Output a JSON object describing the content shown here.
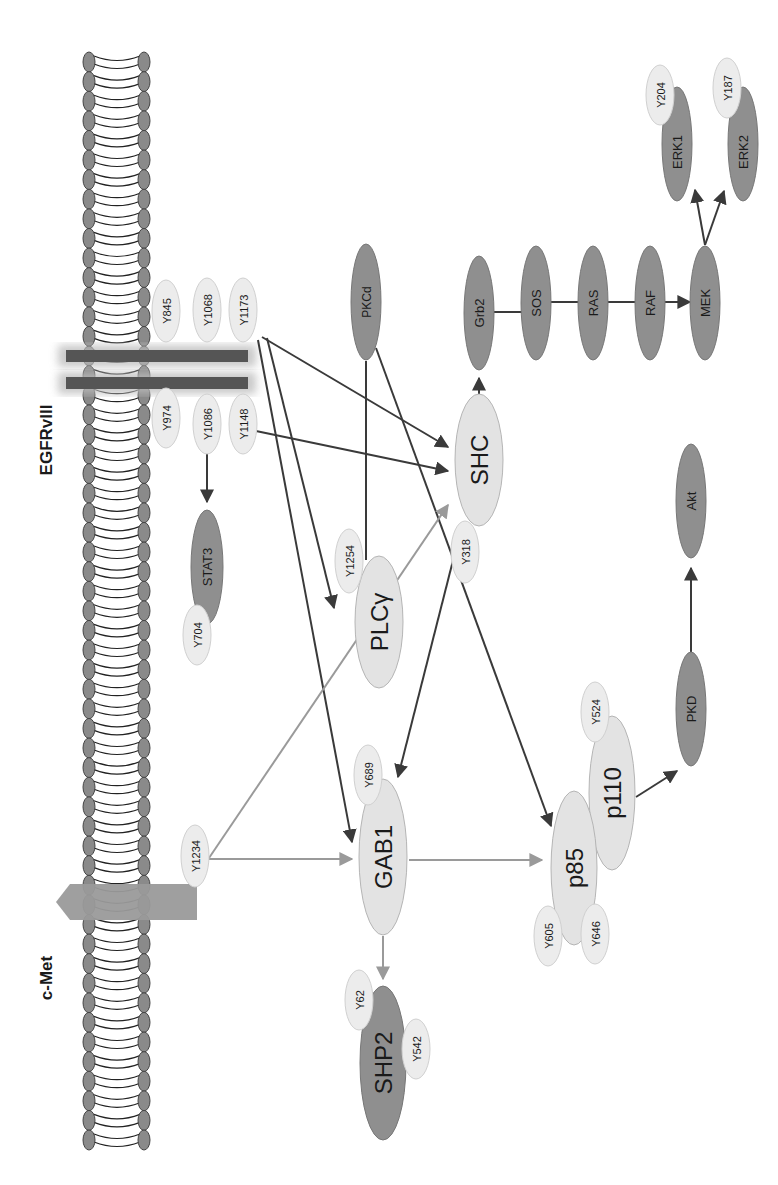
{
  "labels": {
    "egfr": "EGFRvIII",
    "cmet": "c-Met"
  },
  "colors": {
    "dark_node": "#8f8f8f",
    "light_node": "#e3e3e3",
    "site": "#ececec",
    "dark_arrow": "#3a3a3a",
    "light_arrow": "#9a9a9a",
    "membrane_head": "#8a8a8a",
    "receptor_band": "#555555",
    "cmet_arrow": "#9a9a9a"
  },
  "egfr_sites": {
    "y845": "Y845",
    "y1068": "Y1068",
    "y1173": "Y1173",
    "y974": "Y974",
    "y1086": "Y1086",
    "y1148": "Y1148"
  },
  "cmet_site": "Y1234",
  "nodes": {
    "stat3": "STAT3",
    "stat3_site": "Y704",
    "plcg": "PLCγ",
    "plcg_site": "Y1254",
    "pkcd": "PKCd",
    "shc": "SHC",
    "shc_site": "Y318",
    "grb2": "Grb2",
    "sos": "SOS",
    "ras": "RAS",
    "raf": "RAF",
    "mek": "MEK",
    "erk1": "ERK1",
    "erk1_site": "Y204",
    "erk2": "ERK2",
    "erk2_site": "Y187",
    "gab1": "GAB1",
    "gab1_site": "Y689",
    "shp2": "SHP2",
    "shp2_site1": "Y62",
    "shp2_site2": "Y542",
    "p85": "p85",
    "p85_site1": "Y605",
    "p85_site2": "Y646",
    "p110": "p110",
    "p110_site": "Y524",
    "pkd": "PKD",
    "akt": "Akt"
  }
}
